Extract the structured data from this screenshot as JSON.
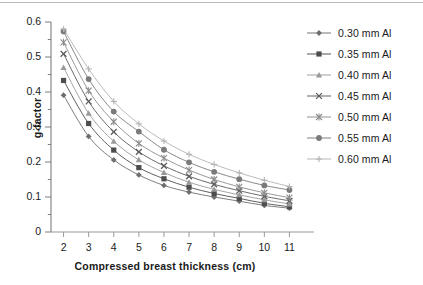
{
  "chart_data": {
    "type": "line",
    "title": "",
    "xlabel": "Compressed breast thickness (cm)",
    "ylabel": "g-factor",
    "xlim": [
      1.5,
      11.5
    ],
    "ylim": [
      0,
      0.6
    ],
    "x": [
      2,
      3,
      4,
      5,
      6,
      7,
      8,
      9,
      10,
      11
    ],
    "xticks": [
      "2",
      "3",
      "4",
      "5",
      "6",
      "7",
      "8",
      "9",
      "10",
      "11"
    ],
    "yticks": [
      "0",
      "0.1",
      "0.2",
      "0.3",
      "0.4",
      "0.5",
      "0.6"
    ],
    "ytick_step": 0.1,
    "yminor_step": 0.05,
    "grid": false,
    "legend_position": "right",
    "series": [
      {
        "name": "0.30 mm Al",
        "marker": "diamond",
        "color": "#6e6e6e",
        "values": [
          0.391,
          0.273,
          0.206,
          0.163,
          0.133,
          0.114,
          0.1,
          0.088,
          0.076,
          0.068
        ]
      },
      {
        "name": "0.35 mm Al",
        "marker": "square",
        "color": "#4d4d4d",
        "values": [
          0.433,
          0.31,
          0.234,
          0.184,
          0.152,
          0.128,
          0.11,
          0.096,
          0.082,
          0.072
        ]
      },
      {
        "name": "0.40 mm Al",
        "marker": "triangle",
        "color": "#9a9a9a",
        "values": [
          0.47,
          0.339,
          0.259,
          0.206,
          0.17,
          0.142,
          0.122,
          0.106,
          0.092,
          0.08
        ]
      },
      {
        "name": "0.45 mm Al",
        "marker": "x",
        "color": "#5a5a5a",
        "values": [
          0.509,
          0.373,
          0.286,
          0.229,
          0.189,
          0.159,
          0.136,
          0.118,
          0.102,
          0.089
        ]
      },
      {
        "name": "0.50 mm Al",
        "marker": "star",
        "color": "#8c8c8c",
        "values": [
          0.542,
          0.404,
          0.315,
          0.253,
          0.211,
          0.177,
          0.15,
          0.129,
          0.112,
          0.098
        ]
      },
      {
        "name": "0.55 mm Al",
        "marker": "circle",
        "color": "#7a7a7a",
        "values": [
          0.573,
          0.437,
          0.344,
          0.287,
          0.235,
          0.199,
          0.172,
          0.151,
          0.133,
          0.12
        ]
      },
      {
        "name": "0.60 mm Al",
        "marker": "plus",
        "color": "#b3b3b3",
        "values": [
          0.58,
          0.466,
          0.373,
          0.309,
          0.26,
          0.222,
          0.193,
          0.169,
          0.148,
          0.13
        ]
      }
    ]
  },
  "axes": {
    "x_title": "Compressed breast thickness (cm)",
    "y_title": "g-factor"
  }
}
